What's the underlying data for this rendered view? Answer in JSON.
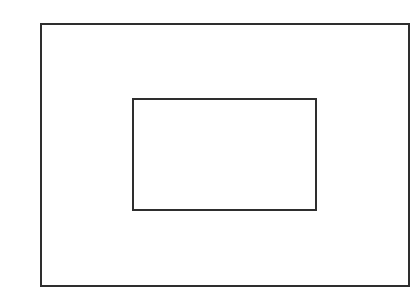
{
  "diagram": {
    "background": "#ffffff",
    "stroke_color": "#2e2e2e",
    "stroke_width": 2,
    "shapes": [
      {
        "id": "outer-rectangle",
        "type": "rectangle",
        "x": 40,
        "y": 23,
        "width": 370,
        "height": 264
      },
      {
        "id": "inner-rectangle",
        "type": "rectangle",
        "x": 132,
        "y": 98,
        "width": 185,
        "height": 113
      }
    ]
  }
}
